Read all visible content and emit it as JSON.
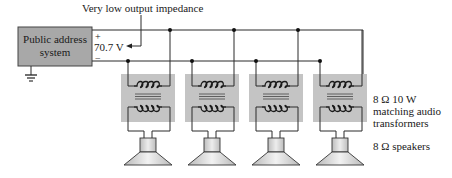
{
  "source": {
    "label_line1": "Public address",
    "label_line2": "system",
    "box_color": "#a8a8a8"
  },
  "output": {
    "plus_sign": "+",
    "minus_sign": "−",
    "voltage": "70.7 V",
    "annotation": "Very low output impedance"
  },
  "transformers": {
    "count": 4,
    "label_line1": "8 Ω 10 W",
    "label_line2": "matching audio",
    "label_line3": "transformers",
    "block_color": "#c4c4c4"
  },
  "speakers": {
    "count": 4,
    "label": "8 Ω speakers"
  },
  "icons": {
    "ground": "ground-symbol-icon",
    "transformer": "transformer-icon",
    "speaker": "speaker-icon"
  }
}
